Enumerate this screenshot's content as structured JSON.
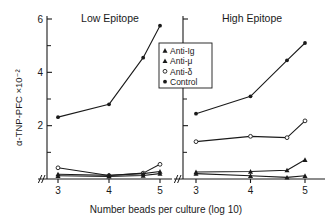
{
  "chart_data": {
    "type": "line",
    "title": "",
    "xlabel": "Number  beads  per  culture  (log 10)",
    "ylabel": "α-TNP-PFC ×10⁻²",
    "ylim": [
      0,
      6
    ],
    "yticks_major": [
      2,
      4,
      6
    ],
    "yticks_minor": [
      1,
      3,
      5
    ],
    "ytick_labels": [
      "2",
      "4",
      "6"
    ],
    "xlim": [
      2.78,
      5.2
    ],
    "xticks": [
      3,
      4,
      5
    ],
    "xtick_labels": [
      "3",
      "4",
      "5"
    ],
    "axis_break": "//",
    "grid": false,
    "legend_position": "center",
    "legend": [
      {
        "label": "Anti-Ig",
        "marker": "filled-triangle"
      },
      {
        "label": "Anti-μ",
        "marker": "filled-triangle"
      },
      {
        "label": "Anti-δ",
        "marker": "open-circle"
      },
      {
        "label": "Control",
        "marker": "filled-circle"
      }
    ],
    "panels": [
      {
        "name": "Low Epitope",
        "series": [
          {
            "name": "Control",
            "marker": "filled-circle",
            "x": [
              3.0,
              4.0,
              4.67,
              5.0
            ],
            "y": [
              2.32,
              2.8,
              4.55,
              5.75
            ]
          },
          {
            "name": "Anti-δ",
            "marker": "open-circle",
            "x": [
              3.0,
              4.0,
              4.67,
              5.0
            ],
            "y": [
              0.42,
              0.13,
              0.22,
              0.55
            ]
          },
          {
            "name": "Anti-Ig",
            "marker": "filled-triangle",
            "x": [
              3.0,
              4.0,
              4.67,
              5.0
            ],
            "y": [
              0.18,
              0.14,
              0.2,
              0.28
            ]
          },
          {
            "name": "Anti-μ",
            "marker": "filled-triangle",
            "x": [
              3.0,
              4.0,
              4.67,
              5.0
            ],
            "y": [
              0.12,
              0.1,
              0.13,
              0.2
            ]
          }
        ]
      },
      {
        "name": "High Epitope",
        "series": [
          {
            "name": "Control",
            "marker": "filled-circle",
            "x": [
              3.0,
              4.0,
              4.67,
              5.0
            ],
            "y": [
              2.45,
              3.1,
              4.45,
              5.1
            ]
          },
          {
            "name": "Anti-δ",
            "marker": "open-circle",
            "x": [
              3.0,
              4.0,
              4.67,
              5.0
            ],
            "y": [
              1.4,
              1.6,
              1.55,
              2.18
            ]
          },
          {
            "name": "Anti-Ig",
            "marker": "filled-triangle",
            "x": [
              3.0,
              4.0,
              4.67,
              5.0
            ],
            "y": [
              0.26,
              0.28,
              0.33,
              0.72
            ]
          },
          {
            "name": "Anti-μ",
            "marker": "filled-triangle",
            "x": [
              3.0,
              4.0,
              4.67,
              5.0
            ],
            "y": [
              0.2,
              0.12,
              0.06,
              0.12
            ]
          }
        ]
      }
    ],
    "colors": {
      "ink": "#1a1a1a",
      "axis": "#1a1a1a",
      "background": "#ffffff"
    }
  }
}
